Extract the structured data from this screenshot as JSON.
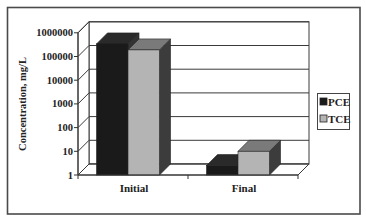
{
  "chart_data": {
    "type": "bar",
    "style": "3d-clustered-column",
    "title": "",
    "xlabel": "",
    "ylabel": "Concentration, mg/L",
    "yscale": "log",
    "ylim": [
      1,
      1000000
    ],
    "yticks": [
      "1",
      "10",
      "100",
      "1000",
      "10000",
      "100000",
      "1000000"
    ],
    "categories": [
      "Initial",
      "Final"
    ],
    "series": [
      {
        "name": "PCE",
        "values": [
          340000,
          2.5
        ],
        "color": "#1a1a1a",
        "side_color": "#333333",
        "top_color": "#2a2a2a"
      },
      {
        "name": "TCE",
        "values": [
          190000,
          10
        ],
        "color": "#b4b4b4",
        "side_color": "#3c3c3c",
        "top_color": "#7a7a7a"
      }
    ],
    "grid": true,
    "legend_position": "right"
  }
}
